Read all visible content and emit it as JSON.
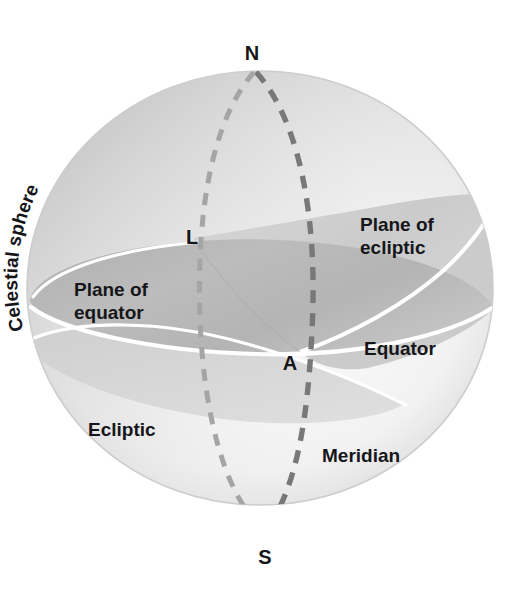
{
  "figure": {
    "kind": "celestial-sphere-diagram",
    "background_color": "#ffffff",
    "sphere": {
      "center_x": 260,
      "center_y": 288,
      "radius_x": 233,
      "radius_y": 217,
      "fill_color": "#fbfbfb",
      "rim_color": "#c9c9c9"
    },
    "colors": {
      "plane_of_equator": "#b6b6b6",
      "plane_of_ecliptic": "#cfcfcf",
      "ecliptic_lower": "#d4d4d4",
      "dashed_meridian": "#7f7f7f",
      "dashed_light": "#a9a9a9",
      "outline_white": "#ffffff",
      "label_text": "#16161a"
    }
  },
  "labels": {
    "north_pole": "N",
    "south_pole": "S",
    "point_l": "L",
    "point_a": "A",
    "celestial_sphere": "Celestial sphere",
    "plane_of_ecliptic_line1": "Plane of",
    "plane_of_ecliptic_line2": "ecliptic",
    "plane_of_equator_line1": "Plane of",
    "plane_of_equator_line2": "equator",
    "equator": "Equator",
    "ecliptic": "Ecliptic",
    "meridian": "Meridian"
  },
  "curved_label_letters": {
    "celestial_sphere_chars": [
      "C",
      "e",
      "l",
      "e",
      "s",
      "t",
      "i",
      "a",
      "l",
      " ",
      "s",
      "p",
      "h",
      "e",
      "r",
      "e"
    ]
  }
}
